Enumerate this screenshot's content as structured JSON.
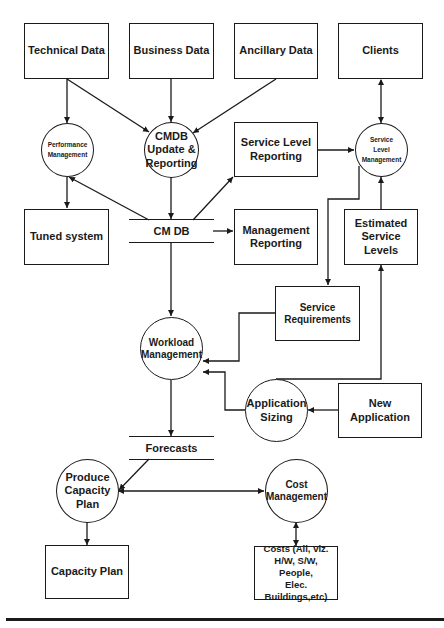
{
  "diagram": {
    "type": "data-flow diagram",
    "line_color": "#1a1a1a",
    "boxes": {
      "technical_data": "Technical Data",
      "business_data": "Business Data",
      "ancillary_data": "Ancillary Data",
      "clients": "Clients",
      "service_level_reporting": "Service Level\nReporting",
      "tuned_system": "Tuned system",
      "management_reporting": "Management\nReporting",
      "estimated_service_levels": "Estimated\nService Levels",
      "service_requirements": "Service\nRequirements",
      "new_application": "New Application",
      "capacity_plan": "Capacity Plan",
      "costs": "Costs (All, viz.\nH/W, S/W, People,\nElec.\nBuildings,etc)"
    },
    "processes": {
      "performance_management": "Performance\nManagement",
      "cmdb_update": "CMDB\nUpdate &\nReporting",
      "service_level_management": "Service\nLevel\nManagement",
      "workload_management": "Workload\nManagement",
      "application_sizing": "Application\nSizing",
      "produce_capacity_plan": "Produce\nCapacity\nPlan",
      "cost_management": "Cost\nManagement"
    },
    "stores": {
      "cm_db": "CM DB",
      "forecasts": "Forecasts"
    }
  }
}
